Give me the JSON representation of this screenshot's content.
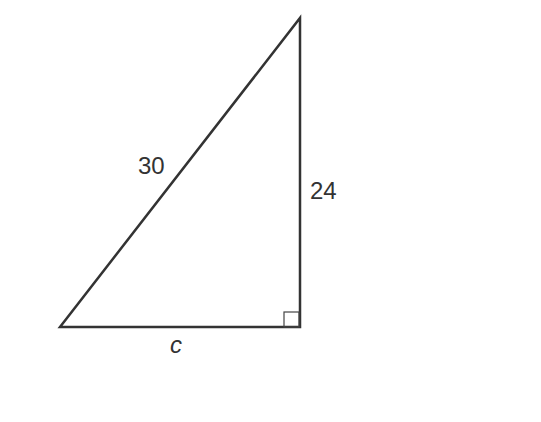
{
  "diagram": {
    "type": "right-triangle",
    "labels": {
      "hypotenuse": "30",
      "vertical_leg": "24",
      "horizontal_leg": "c"
    },
    "right_angle_marker": true,
    "stroke_color": "#333333",
    "background": "#ffffff"
  }
}
